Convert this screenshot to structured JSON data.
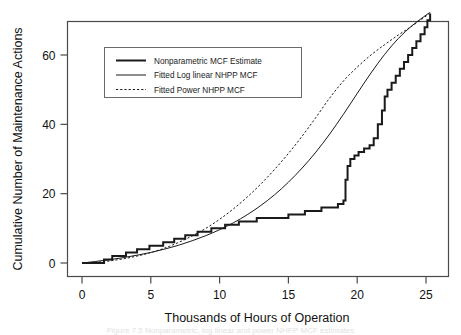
{
  "figure": {
    "background_color": "#ffffff",
    "frame_color": "#4a4a4a",
    "caption_sliver": "Figure 7.5 Nonparametric, log linear and power NHPP MCF estimates"
  },
  "chart_data": {
    "type": "line",
    "title": "",
    "xlabel": "Thousands of Hours of Operation",
    "ylabel": "Cumulative Number of Maintenance Actions",
    "xlim": [
      -0.8,
      26.2
    ],
    "ylim": [
      -1.5,
      74
    ],
    "xticks": [
      0,
      5,
      10,
      15,
      20,
      25
    ],
    "xticklabels": [
      "0",
      "5",
      "10",
      "15",
      "20",
      "25"
    ],
    "yticks": [
      0,
      20,
      40,
      60
    ],
    "yticklabels": [
      "0",
      "20",
      "40",
      "60"
    ],
    "grid": false,
    "legend_position": "upper left inside",
    "series": [
      {
        "name": "Nonparametric MCF Estimate",
        "style": "step",
        "linestyle": "solid-thick",
        "color": "#1a1a1a",
        "linewidth": 2.0,
        "x": [
          0.0,
          1.4,
          1.6,
          1.9,
          2.2,
          2.9,
          3.2,
          3.6,
          4.0,
          4.4,
          4.9,
          5.4,
          5.9,
          6.3,
          6.7,
          7.1,
          7.5,
          7.9,
          8.4,
          8.9,
          9.4,
          9.9,
          10.4,
          10.9,
          11.4,
          11.9,
          12.3,
          12.7,
          13.2,
          13.8,
          14.4,
          15.0,
          15.6,
          16.2,
          16.8,
          17.4,
          18.0,
          18.6,
          19.0,
          19.15,
          19.3,
          19.5,
          19.8,
          20.1,
          20.5,
          20.9,
          21.2,
          21.5,
          21.8,
          22.0,
          22.2,
          22.5,
          22.8,
          23.1,
          23.4,
          23.7,
          24.0,
          24.3,
          24.6,
          24.9,
          25.1,
          25.3
        ],
        "y": [
          0,
          0,
          1,
          1,
          2,
          2,
          3,
          3,
          4,
          4,
          5,
          5,
          6,
          6,
          7,
          7,
          8,
          8,
          9,
          9,
          10,
          10,
          11,
          11,
          12,
          12,
          12,
          13,
          13,
          13,
          13,
          14,
          14,
          15,
          15,
          16,
          16,
          17,
          18,
          24,
          28,
          30,
          31,
          32,
          33,
          34,
          36,
          40,
          44,
          48,
          50,
          52,
          54,
          56,
          58,
          60,
          62,
          64,
          66,
          68,
          70,
          72
        ]
      },
      {
        "name": "Fitted Log linear NHPP MCF",
        "style": "smooth",
        "linestyle": "solid-thin",
        "color": "#1a1a1a",
        "linewidth": 1.0,
        "model": "log-linear",
        "x": [
          0,
          1,
          2,
          3,
          4,
          5,
          6,
          7,
          8,
          9,
          10,
          11,
          12,
          13,
          14,
          15,
          16,
          17,
          18,
          19,
          20,
          21,
          22,
          23,
          24,
          25,
          25.3
        ],
        "y": [
          0.0,
          0.45,
          0.95,
          1.55,
          2.25,
          3.05,
          4.0,
          5.1,
          6.4,
          7.9,
          9.6,
          11.6,
          13.9,
          16.6,
          19.7,
          23.3,
          27.4,
          32.0,
          37.2,
          42.9,
          48.9,
          54.8,
          60.2,
          64.8,
          68.5,
          71.5,
          72.3
        ]
      },
      {
        "name": "Fitted Power NHPP MCF",
        "style": "smooth",
        "linestyle": "dotted",
        "color": "#1a1a1a",
        "linewidth": 1.0,
        "model": "power",
        "x": [
          0,
          1,
          2,
          3,
          4,
          5,
          6,
          7,
          8,
          9,
          10,
          11,
          12,
          13,
          14,
          15,
          16,
          17,
          18,
          19,
          20,
          21,
          22,
          23,
          24,
          25,
          25.3
        ],
        "y": [
          0.0,
          0.2,
          0.6,
          1.2,
          2.0,
          3.0,
          4.3,
          5.9,
          7.8,
          10.0,
          12.6,
          15.6,
          19.0,
          22.8,
          27.0,
          31.6,
          36.6,
          42.0,
          47.6,
          52.5,
          56.5,
          60.0,
          63.0,
          65.8,
          68.4,
          71.2,
          72.3
        ]
      }
    ]
  },
  "legend": {
    "items": [
      {
        "label": "Nonparametric MCF Estimate",
        "sample": "solid-thick"
      },
      {
        "label": "Fitted Log linear NHPP MCF",
        "sample": "solid-thin"
      },
      {
        "label": "Fitted Power NHPP MCF",
        "sample": "dotted"
      }
    ]
  }
}
